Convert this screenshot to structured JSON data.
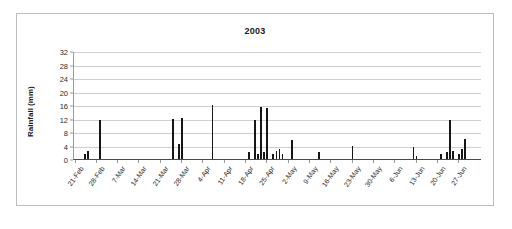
{
  "chart": {
    "title": "2003",
    "y_axis_title": "Rainfall (mm)"
  },
  "chart_data": {
    "type": "bar",
    "title": "2003",
    "xlabel": "",
    "ylabel": "Rainfall (mm)",
    "ylim": [
      0,
      32
    ],
    "yticks": [
      0,
      4,
      8,
      12,
      16,
      20,
      24,
      28,
      32
    ],
    "grid": true,
    "legend": null,
    "x_tick_labels": [
      "21-Feb",
      "28-Feb",
      "7-Mar",
      "14-Mar",
      "21-Mar",
      "28-Mar",
      "4-Apr",
      "11-Apr",
      "18-Apr",
      "25-Apr",
      "2-May",
      "9-May",
      "16-May",
      "23-May",
      "30-May",
      "6-Jun",
      "13-Jun",
      "20-Jun",
      "27-Jun"
    ],
    "x_tick_interval_days": 7,
    "x_start_date": "21-Feb",
    "x_end_date": "3-Jul",
    "series": [
      {
        "name": "Daily rainfall",
        "color": "#161616",
        "values": [
          0,
          0,
          0,
          1.5,
          2.5,
          0,
          0,
          0,
          11.5,
          0,
          0,
          0,
          0,
          0,
          0,
          0,
          0,
          0,
          0,
          0,
          0,
          0,
          0,
          0,
          0,
          0,
          0,
          0,
          0,
          0,
          0,
          0,
          11.8,
          0,
          4.5,
          12.2,
          0,
          0,
          0,
          0,
          0,
          0,
          0,
          0,
          0,
          16.0,
          0,
          0,
          0,
          0,
          0,
          0,
          0,
          0,
          0,
          0,
          0,
          2.0,
          0,
          11.5,
          1.5,
          15.5,
          2.0,
          15.0,
          0,
          1.5,
          2.5,
          3.0,
          1.5,
          0,
          0,
          5.5,
          0,
          0,
          0,
          0,
          0,
          0,
          0,
          0,
          2.0,
          0,
          0,
          0,
          0,
          0,
          0,
          0,
          0,
          0,
          0,
          4.0,
          0,
          0,
          0,
          0,
          0,
          0,
          0,
          0,
          0,
          0,
          0,
          0,
          0,
          0,
          0,
          0,
          0,
          0,
          0,
          3.5,
          1.0,
          0,
          0,
          0,
          0,
          0,
          0,
          0,
          1.5,
          0,
          2.0,
          11.5,
          2.5,
          0,
          1.5,
          3.0,
          6.0,
          0,
          0,
          0,
          0,
          0
        ]
      }
    ]
  }
}
